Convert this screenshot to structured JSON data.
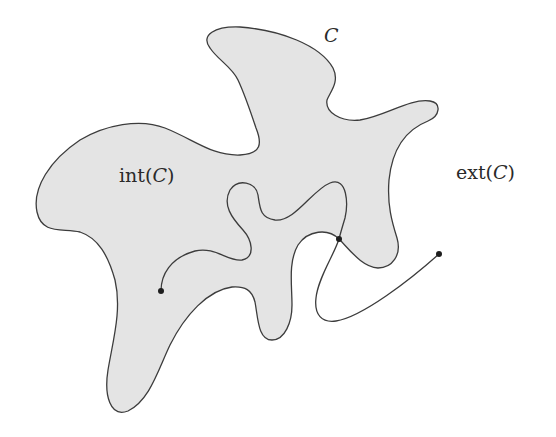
{
  "figure": {
    "labels": {
      "curve": "C",
      "interior_prefix": "int(",
      "interior_var": "C",
      "interior_suffix": ")",
      "exterior_prefix": "ext(",
      "exterior_var": "C",
      "exterior_suffix": ")"
    },
    "points": [
      {
        "name": "start-point",
        "region": "interior"
      },
      {
        "name": "crossing-point",
        "region": "on-curve"
      },
      {
        "name": "end-point",
        "region": "exterior"
      }
    ],
    "colors": {
      "interior_fill": "#e4e4e4",
      "stroke": "#3c3c3c",
      "background": "#ffffff"
    }
  }
}
